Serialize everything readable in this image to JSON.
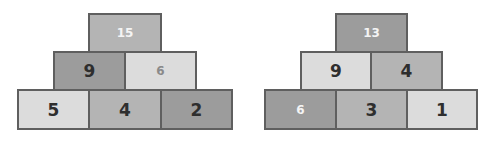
{
  "pyramids": [
    {
      "name": "left",
      "top": {
        "value": "15"
      },
      "middle": [
        {
          "value": "9"
        },
        {
          "value": "6"
        }
      ],
      "bottom": [
        {
          "value": "5"
        },
        {
          "value": "4"
        },
        {
          "value": "2"
        }
      ]
    },
    {
      "name": "right",
      "top": {
        "value": "13"
      },
      "middle": [
        {
          "value": "9"
        },
        {
          "value": "4"
        }
      ],
      "bottom": [
        {
          "value": "6"
        },
        {
          "value": "3"
        },
        {
          "value": "1"
        }
      ]
    }
  ]
}
